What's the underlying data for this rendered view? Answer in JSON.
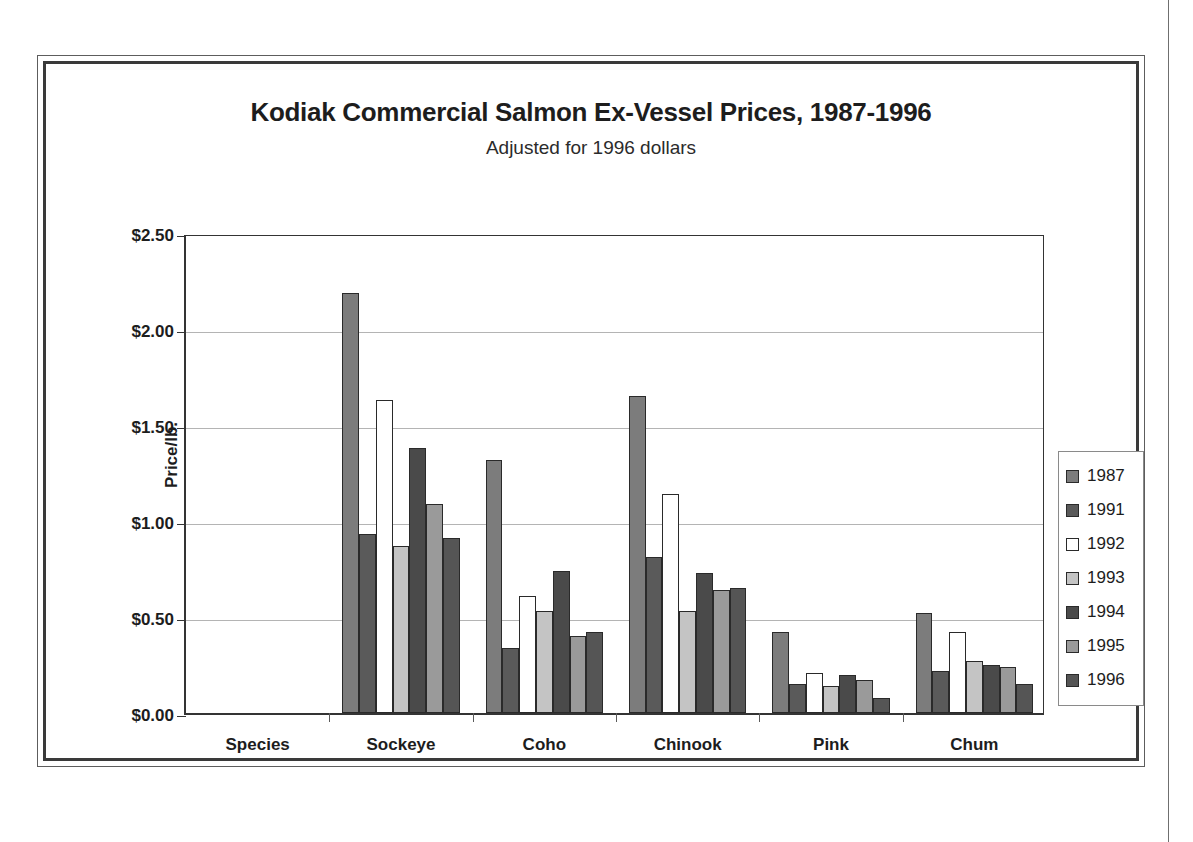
{
  "chart_data": {
    "type": "bar",
    "title": "Kodiak Commercial Salmon Ex-Vessel Prices, 1987-1996",
    "subtitle": "Adjusted for 1996 dollars",
    "xlabel": "Species",
    "ylabel": "Price/lb.",
    "ylim": [
      0,
      2.5
    ],
    "ytick_step": 0.5,
    "ytick_labels": [
      "$2.50",
      "$2.00",
      "$1.50",
      "$1.00",
      "$0.50",
      "$0.00"
    ],
    "ytick_values": [
      2.5,
      2.0,
      1.5,
      1.0,
      0.5,
      0.0
    ],
    "grid": true,
    "legend_position": "right",
    "categories": [
      "Species",
      "Sockeye",
      "Coho",
      "Chinook",
      "Pink",
      "Chum"
    ],
    "series": [
      {
        "name": "1987",
        "color": "#7c7c7c",
        "values": [
          null,
          2.19,
          1.32,
          1.65,
          0.42,
          0.52
        ]
      },
      {
        "name": "1991",
        "color": "#5a5a5a",
        "values": [
          null,
          0.93,
          0.34,
          0.81,
          0.15,
          0.22
        ]
      },
      {
        "name": "1992",
        "color": "#ffffff",
        "values": [
          null,
          1.63,
          0.61,
          1.14,
          0.21,
          0.42
        ]
      },
      {
        "name": "1993",
        "color": "#c4c4c4",
        "values": [
          null,
          0.87,
          0.53,
          0.53,
          0.14,
          0.27
        ]
      },
      {
        "name": "1994",
        "color": "#4a4a4a",
        "values": [
          null,
          1.38,
          0.74,
          0.73,
          0.2,
          0.25
        ]
      },
      {
        "name": "1995",
        "color": "#9a9a9a",
        "values": [
          null,
          1.09,
          0.4,
          0.64,
          0.17,
          0.24
        ]
      },
      {
        "name": "1996",
        "color": "#555555",
        "values": [
          null,
          0.91,
          0.42,
          0.65,
          0.08,
          0.15
        ]
      }
    ]
  },
  "legend": {
    "entries": [
      {
        "label": "1987"
      },
      {
        "label": "1991"
      },
      {
        "label": "1992"
      },
      {
        "label": "1993"
      },
      {
        "label": "1994"
      },
      {
        "label": "1995"
      },
      {
        "label": "1996"
      }
    ]
  }
}
